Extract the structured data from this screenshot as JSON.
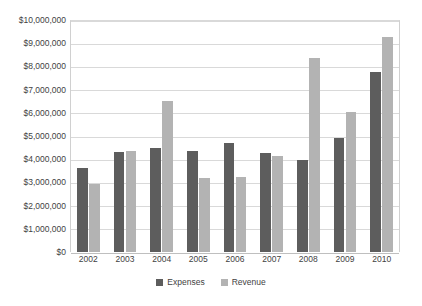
{
  "chart_data": {
    "type": "bar",
    "title": "",
    "subtitle": "",
    "xlabel": "",
    "ylabel": "",
    "categories": [
      "2002",
      "2003",
      "2004",
      "2005",
      "2006",
      "2007",
      "2008",
      "2009",
      "2010"
    ],
    "series": [
      {
        "name": "Expenses",
        "color": "#5d5d5d",
        "values": [
          3600000,
          4300000,
          4500000,
          4350000,
          4700000,
          4250000,
          3950000,
          4900000,
          7750000
        ]
      },
      {
        "name": "Revenue",
        "color": "#b3b3b3",
        "values": [
          2950000,
          4350000,
          6500000,
          3200000,
          3250000,
          4150000,
          8350000,
          6050000,
          9250000
        ]
      }
    ],
    "ylim": [
      0,
      10000000
    ],
    "ytick_values": [
      0,
      1000000,
      2000000,
      3000000,
      4000000,
      5000000,
      6000000,
      7000000,
      8000000,
      9000000,
      10000000
    ],
    "ytick_labels": [
      "$0",
      "$1,000,000",
      "$2,000,000",
      "$3,000,000",
      "$4,000,000",
      "$5,000,000",
      "$6,000,000",
      "$7,000,000",
      "$8,000,000",
      "$9,000,000",
      "$10,000,000"
    ],
    "grid": true,
    "grid_axis": "y",
    "legend": [
      "Expenses",
      "Revenue"
    ],
    "legend_position": "bottom"
  }
}
